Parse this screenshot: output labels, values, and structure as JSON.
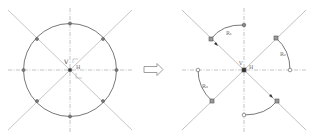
{
  "diagram": {
    "left_panel": {
      "center_label_v": "V",
      "center_label_h": "H",
      "points_count": 8
    },
    "arrow": {
      "direction": "right",
      "style": "hollow"
    },
    "right_panel": {
      "center_label_v": "V",
      "center_label_h": "H",
      "arc_labels": [
        "R₁",
        "R₂",
        "R₃"
      ]
    },
    "colors": {
      "axis_line": "#aaaaaa",
      "diagonal_line": "#b5b5b5",
      "circle": "#555555",
      "point": "#666666",
      "arrow_outline": "#777777"
    }
  }
}
